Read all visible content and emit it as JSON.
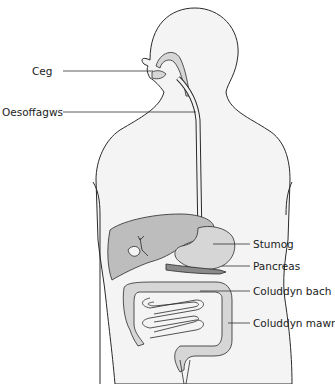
{
  "diagram": {
    "colors": {
      "outline": "#2a2a2a",
      "body_fill": "#f4f4f4",
      "organ_fill": "#d6d6d6",
      "organ_dark": "#bdbdbd",
      "leader": "#333333",
      "background": "#ffffff"
    },
    "labels": {
      "mouth": "Ceg",
      "oesophagus": "Oesoffagws",
      "stomach": "Stumog",
      "pancreas": "Pancreas",
      "small_intestine": "Coluddyn bach",
      "large_intestine": "Coluddyn mawr"
    }
  }
}
